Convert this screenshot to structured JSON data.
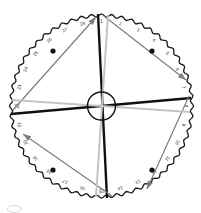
{
  "figure": {
    "background_color": "#ffffff",
    "width": 201,
    "height": 213
  },
  "dial": {
    "center_x": 101.5,
    "center_y": 106,
    "outer_radius": 92,
    "scallop_count": 56,
    "scallop_depth": 3.0,
    "rim_color": "#1a1a1a",
    "rim_width": 1.3,
    "label_radius": 84,
    "tick_count": 28,
    "tick_start_angle_deg": -90,
    "tick_labels": [
      "1",
      "2",
      "3",
      "4",
      "5",
      "6",
      "7",
      "8",
      "9",
      "10",
      "11",
      "12",
      "13",
      "14",
      "15",
      "16",
      "17",
      "18",
      "19",
      "20",
      "21",
      "22",
      "23",
      "24",
      "25",
      "26",
      "27",
      "28"
    ],
    "label_color": "#2b2b2b",
    "label_font_size": 4.6
  },
  "hub": {
    "radius": 14,
    "stroke_color": "#111111",
    "stroke_width": 1.4,
    "fill": "none"
  },
  "quadrant_dots": {
    "radius": 2.6,
    "color": "#111111",
    "positions": [
      {
        "name": "dot-top-left",
        "x": 53,
        "y": 51
      },
      {
        "name": "dot-top-right",
        "x": 152,
        "y": 51
      },
      {
        "name": "dot-bottom-left",
        "x": 53,
        "y": 170
      },
      {
        "name": "dot-bottom-right",
        "x": 152,
        "y": 170
      }
    ]
  },
  "chords": [
    {
      "name": "chord-vertical-black",
      "color": "#111111",
      "width": 2.4,
      "x1": 98,
      "y1": 14,
      "x2": 107,
      "y2": 198,
      "arrow_at": "none"
    },
    {
      "name": "chord-horizontal-black",
      "color": "#111111",
      "width": 2.4,
      "x1": 11,
      "y1": 114,
      "x2": 191,
      "y2": 98,
      "arrow_at": "none"
    },
    {
      "name": "chord-gray-upleft-arrow",
      "color": "#7d7d7d",
      "width": 1.2,
      "x1": 13,
      "y1": 110,
      "x2": 96,
      "y2": 17,
      "arrow_at": "end"
    },
    {
      "name": "chord-gray-downright-arrow",
      "color": "#7d7d7d",
      "width": 1.2,
      "x1": 104,
      "y1": 16,
      "x2": 186,
      "y2": 80,
      "arrow_at": "end"
    },
    {
      "name": "chord-gray-downleft-arrow",
      "color": "#7d7d7d",
      "width": 1.2,
      "x1": 112,
      "y1": 196,
      "x2": 23,
      "y2": 134,
      "arrow_at": "end"
    },
    {
      "name": "chord-gray-downleft-arrow-2",
      "color": "#7d7d7d",
      "width": 1.2,
      "x1": 189,
      "y1": 96,
      "x2": 147,
      "y2": 189,
      "arrow_at": "end"
    },
    {
      "name": "chord-lightgray-vertical",
      "color": "#c4c4c4",
      "width": 2.0,
      "x1": 108,
      "y1": 15,
      "x2": 96,
      "y2": 197,
      "arrow_at": "none"
    },
    {
      "name": "chord-lightgray-horizontal",
      "color": "#c4c4c4",
      "width": 2.0,
      "x1": 12,
      "y1": 100,
      "x2": 190,
      "y2": 112,
      "arrow_at": "none"
    }
  ],
  "corner_mark": {
    "name": "partial-arc-bottom-left",
    "x": 14,
    "y": 209,
    "rx": 7,
    "ry": 3.5,
    "color": "#d8d8d8",
    "stroke_width": 1
  }
}
